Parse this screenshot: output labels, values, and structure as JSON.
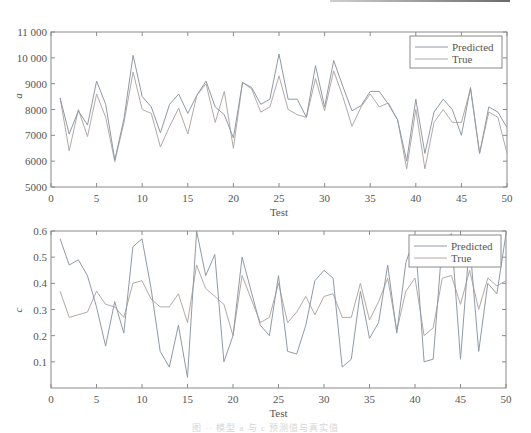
{
  "chart_data": [
    {
      "type": "line",
      "title": "",
      "xlabel": "Test",
      "ylabel": "a",
      "xlim": [
        0,
        50
      ],
      "ylim": [
        5000,
        11000
      ],
      "xticks": [
        0,
        5,
        10,
        15,
        20,
        25,
        30,
        35,
        40,
        45,
        50
      ],
      "yticks": [
        5000,
        6000,
        7000,
        8000,
        9000,
        10000,
        11000
      ],
      "ytick_labels": [
        "5000",
        "6000",
        "7000",
        "8000",
        "9000",
        "10 000",
        "11 000"
      ],
      "grid": false,
      "legend_position": "upper right",
      "x": [
        1,
        2,
        3,
        4,
        5,
        6,
        7,
        8,
        9,
        10,
        11,
        12,
        13,
        14,
        15,
        16,
        17,
        18,
        19,
        20,
        21,
        22,
        23,
        24,
        25,
        26,
        27,
        28,
        29,
        30,
        31,
        32,
        33,
        34,
        35,
        36,
        37,
        38,
        39,
        40,
        41,
        42,
        43,
        44,
        45,
        46,
        47,
        48,
        49,
        50
      ],
      "series": [
        {
          "name": "Predicted",
          "color": "#8f9aa6",
          "values": [
            8450,
            7050,
            7950,
            7400,
            9100,
            8200,
            6050,
            7650,
            10100,
            8500,
            8100,
            7100,
            8200,
            8600,
            7850,
            8550,
            9100,
            8100,
            7800,
            6900,
            9050,
            8850,
            8200,
            8400,
            10150,
            8400,
            8400,
            7700,
            9700,
            8100,
            9900,
            8900,
            7950,
            8150,
            8700,
            8700,
            8200,
            7600,
            6000,
            8400,
            6300,
            7900,
            8400,
            8000,
            7000,
            8850,
            6300,
            8100,
            7900,
            7300
          ]
        },
        {
          "name": "True",
          "color": "#b3aaa6",
          "values": [
            8450,
            6400,
            8000,
            6950,
            8600,
            7700,
            5980,
            7500,
            9450,
            8000,
            7850,
            6550,
            7350,
            8050,
            7050,
            8550,
            9000,
            7500,
            8700,
            6500,
            9050,
            8800,
            7900,
            8100,
            9300,
            8000,
            7800,
            7700,
            9200,
            7950,
            9500,
            8500,
            7350,
            8100,
            8600,
            8100,
            8250,
            7600,
            5700,
            8000,
            5700,
            7500,
            8000,
            7500,
            7500,
            8800,
            6300,
            7900,
            7700,
            6300
          ]
        }
      ]
    },
    {
      "type": "line",
      "title": "",
      "xlabel": "Test",
      "ylabel": "c",
      "xlim": [
        0,
        50
      ],
      "ylim": [
        0,
        0.6
      ],
      "xticks": [
        0,
        5,
        10,
        15,
        20,
        25,
        30,
        35,
        40,
        45,
        50
      ],
      "yticks": [
        0.1,
        0.2,
        0.3,
        0.4,
        0.5,
        0.6
      ],
      "ytick_labels": [
        "0.1",
        "0.2",
        "0.3",
        "0.4",
        "0.5",
        "0.6"
      ],
      "grid": false,
      "legend_position": "upper right",
      "x": [
        1,
        2,
        3,
        4,
        5,
        6,
        7,
        8,
        9,
        10,
        11,
        12,
        13,
        14,
        15,
        16,
        17,
        18,
        19,
        20,
        21,
        22,
        23,
        24,
        25,
        26,
        27,
        28,
        29,
        30,
        31,
        32,
        33,
        34,
        35,
        36,
        37,
        38,
        39,
        40,
        41,
        42,
        43,
        44,
        45,
        46,
        47,
        48,
        49,
        50
      ],
      "series": [
        {
          "name": "Predicted",
          "color": "#8f9aa6",
          "values": [
            0.57,
            0.47,
            0.49,
            0.43,
            0.31,
            0.16,
            0.33,
            0.21,
            0.54,
            0.57,
            0.38,
            0.14,
            0.08,
            0.24,
            0.04,
            0.6,
            0.43,
            0.51,
            0.1,
            0.2,
            0.5,
            0.37,
            0.24,
            0.2,
            0.43,
            0.14,
            0.13,
            0.24,
            0.41,
            0.45,
            0.42,
            0.08,
            0.11,
            0.37,
            0.19,
            0.25,
            0.47,
            0.21,
            0.48,
            0.58,
            0.1,
            0.11,
            0.56,
            0.59,
            0.11,
            0.56,
            0.14,
            0.4,
            0.36,
            0.59
          ]
        },
        {
          "name": "True",
          "color": "#b3aaa6",
          "values": [
            0.37,
            0.27,
            0.28,
            0.29,
            0.37,
            0.32,
            0.31,
            0.27,
            0.4,
            0.41,
            0.34,
            0.31,
            0.31,
            0.36,
            0.25,
            0.47,
            0.38,
            0.35,
            0.32,
            0.2,
            0.43,
            0.34,
            0.25,
            0.27,
            0.4,
            0.25,
            0.29,
            0.35,
            0.28,
            0.35,
            0.36,
            0.27,
            0.27,
            0.4,
            0.26,
            0.33,
            0.42,
            0.22,
            0.37,
            0.42,
            0.2,
            0.23,
            0.42,
            0.43,
            0.32,
            0.45,
            0.3,
            0.42,
            0.39,
            0.41
          ]
        }
      ]
    }
  ],
  "legend": {
    "predicted": "Predicted",
    "true": "True"
  },
  "caption": "图 ·· 模型 a 与 c 预测值与真实值"
}
